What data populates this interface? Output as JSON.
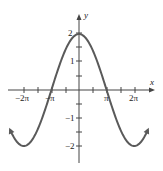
{
  "chart_data": {
    "type": "line",
    "title": "",
    "function": "y = 2cos(x/2)",
    "xlabel": "x",
    "ylabel": "y",
    "xlim": [
      -7.85,
      7.85
    ],
    "ylim": [
      -2.5,
      2.5
    ],
    "x_ticks": [
      "-2π",
      "-3π/2",
      "-π",
      "-π/2",
      "0",
      "π/2",
      "π",
      "3π/2",
      "2π"
    ],
    "x_tick_labels": [
      "-2π",
      "-π",
      "π",
      "2π"
    ],
    "y_ticks": [
      -2,
      -1.5,
      -1,
      -0.5,
      0.5,
      1,
      1.5,
      2
    ],
    "y_tick_labels": [
      "2",
      "1",
      "-1",
      "-2"
    ],
    "key_points": [
      {
        "x": "-2π",
        "y": -2
      },
      {
        "x": "-π",
        "y": 0
      },
      {
        "x": "0",
        "y": 2
      },
      {
        "x": "π",
        "y": 0
      },
      {
        "x": "2π",
        "y": -2
      }
    ],
    "grid": false,
    "series": [
      {
        "name": "2cos(x/2)",
        "color": "#555555"
      }
    ]
  },
  "labels": {
    "x_axis": "x",
    "y_axis": "y",
    "xt_neg2pi": "−2π",
    "xt_negpi": "−π",
    "xt_pi": "π",
    "xt_2pi": "2π",
    "yt_2": "2",
    "yt_1": "1",
    "yt_neg1": "−1",
    "yt_neg2": "−2"
  }
}
